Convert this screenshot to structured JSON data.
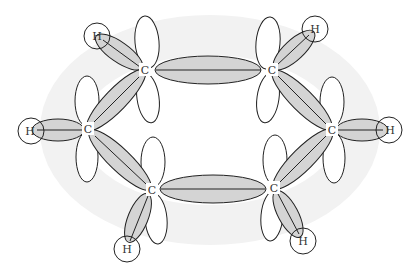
{
  "diagram": {
    "title": "",
    "colors": {
      "bond_fill": "#d4d4d4",
      "outline": "#222222",
      "background_ring": "#f0f0f0"
    },
    "carbons": [
      {
        "id": "c1",
        "label": "C",
        "x": 145,
        "y": 70
      },
      {
        "id": "c2",
        "label": "C",
        "x": 272,
        "y": 70
      },
      {
        "id": "c3",
        "label": "C",
        "x": 332,
        "y": 130
      },
      {
        "id": "c4",
        "label": "C",
        "x": 274,
        "y": 188
      },
      {
        "id": "c5",
        "label": "C",
        "x": 152,
        "y": 190
      },
      {
        "id": "c6",
        "label": "C",
        "x": 88,
        "y": 129
      }
    ],
    "hydrogens": [
      {
        "id": "h1",
        "label": "H",
        "x": 97,
        "y": 36,
        "bonded_to": "c1"
      },
      {
        "id": "h2",
        "label": "H",
        "x": 315,
        "y": 29,
        "bonded_to": "c2"
      },
      {
        "id": "h3",
        "label": "H",
        "x": 389,
        "y": 130,
        "bonded_to": "c3"
      },
      {
        "id": "h4",
        "label": "H",
        "x": 303,
        "y": 241,
        "bonded_to": "c4"
      },
      {
        "id": "h5",
        "label": "H",
        "x": 127,
        "y": 249,
        "bonded_to": "c5"
      },
      {
        "id": "h6",
        "label": "H",
        "x": 31,
        "y": 131,
        "bonded_to": "c6"
      }
    ],
    "cc_bonds": [
      {
        "from": "c1",
        "to": "c2"
      },
      {
        "from": "c2",
        "to": "c3"
      },
      {
        "from": "c3",
        "to": "c4"
      },
      {
        "from": "c4",
        "to": "c5"
      },
      {
        "from": "c5",
        "to": "c6"
      },
      {
        "from": "c6",
        "to": "c1"
      }
    ]
  }
}
